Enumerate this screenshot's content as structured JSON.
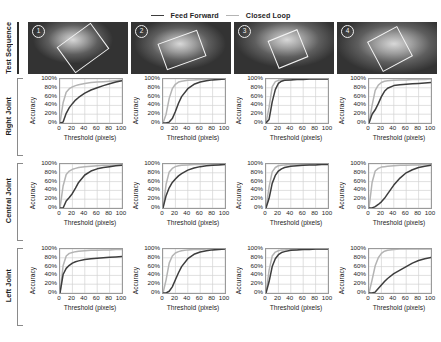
{
  "legend": {
    "items": [
      {
        "label": "Feed Forward",
        "color": "#3d3d3d",
        "icon": "line-swatch-icon"
      },
      {
        "label": "Closed Loop",
        "color": "#b4b4b4",
        "icon": "line-swatch-icon"
      }
    ]
  },
  "rows": [
    {
      "label": "Test Sequence"
    },
    {
      "label": "Right Joint"
    },
    {
      "label": "Central Joint"
    },
    {
      "label": "Left Joint"
    }
  ],
  "sequence": {
    "frames": [
      {
        "badge": "1"
      },
      {
        "badge": "2"
      },
      {
        "badge": "3"
      },
      {
        "badge": "4"
      }
    ]
  },
  "axes": {
    "xlabel": "Threshold (pixels)",
    "ylabel": "Accuracy",
    "xticks": [
      "0",
      "20",
      "40",
      "60",
      "80",
      "100"
    ],
    "yticks": [
      "100%",
      "80%",
      "60%",
      "40%",
      "20%",
      "0%"
    ],
    "xlim": [
      0,
      100
    ],
    "ylim": [
      0,
      100
    ]
  },
  "chart_data": [
    {
      "type": "line",
      "title": "Right Joint - Sequence 1",
      "row": "Right Joint",
      "column": 1,
      "xlabel": "Threshold (pixels)",
      "ylabel": "Accuracy",
      "xlim": [
        0,
        100
      ],
      "ylim": [
        0,
        100
      ],
      "grid": true,
      "legend_position": "top-center",
      "x": [
        0,
        5,
        10,
        15,
        20,
        25,
        30,
        40,
        50,
        60,
        70,
        80,
        90,
        100
      ],
      "series": [
        {
          "name": "Closed Loop",
          "color": "#b4b4b4",
          "values": [
            0,
            46,
            70,
            78,
            82,
            85,
            87,
            90,
            92,
            93,
            94,
            95,
            96,
            97
          ]
        },
        {
          "name": "Feed Forward",
          "color": "#3d3d3d",
          "values": [
            0,
            2,
            22,
            35,
            44,
            52,
            58,
            68,
            75,
            80,
            85,
            89,
            93,
            96
          ]
        }
      ]
    },
    {
      "type": "line",
      "title": "Right Joint - Sequence 2",
      "row": "Right Joint",
      "column": 2,
      "xlabel": "Threshold (pixels)",
      "ylabel": "Accuracy",
      "xlim": [
        0,
        100
      ],
      "ylim": [
        0,
        100
      ],
      "grid": true,
      "x": [
        0,
        5,
        10,
        15,
        20,
        25,
        30,
        40,
        50,
        60,
        70,
        80,
        90,
        100
      ],
      "series": [
        {
          "name": "Closed Loop",
          "color": "#b4b4b4",
          "values": [
            0,
            20,
            56,
            78,
            88,
            93,
            95,
            97,
            98,
            99,
            99,
            100,
            100,
            100
          ]
        },
        {
          "name": "Feed Forward",
          "color": "#3d3d3d",
          "values": [
            0,
            0,
            2,
            10,
            26,
            45,
            60,
            78,
            88,
            93,
            96,
            98,
            99,
            100
          ]
        }
      ]
    },
    {
      "type": "line",
      "title": "Right Joint - Sequence 3",
      "row": "Right Joint",
      "column": 3,
      "xlabel": "Threshold (pixels)",
      "ylabel": "Accuracy",
      "xlim": [
        0,
        100
      ],
      "ylim": [
        0,
        100
      ],
      "grid": true,
      "x": [
        0,
        5,
        10,
        15,
        20,
        25,
        30,
        40,
        50,
        60,
        70,
        80,
        90,
        100
      ],
      "series": [
        {
          "name": "Closed Loop",
          "color": "#b4b4b4",
          "values": [
            0,
            36,
            82,
            94,
            97,
            98,
            99,
            99,
            100,
            100,
            100,
            100,
            100,
            100
          ]
        },
        {
          "name": "Feed Forward",
          "color": "#3d3d3d",
          "values": [
            0,
            8,
            48,
            76,
            90,
            95,
            97,
            98,
            99,
            99,
            100,
            100,
            100,
            100
          ]
        }
      ]
    },
    {
      "type": "line",
      "title": "Right Joint - Sequence 4",
      "row": "Right Joint",
      "column": 4,
      "xlabel": "Threshold (pixels)",
      "ylabel": "Accuracy",
      "xlim": [
        0,
        100
      ],
      "ylim": [
        0,
        100
      ],
      "grid": true,
      "x": [
        0,
        5,
        10,
        15,
        20,
        25,
        30,
        40,
        50,
        60,
        70,
        80,
        90,
        100
      ],
      "series": [
        {
          "name": "Closed Loop",
          "color": "#b4b4b4",
          "values": [
            0,
            40,
            74,
            86,
            92,
            95,
            96,
            97,
            98,
            98,
            99,
            99,
            99,
            100
          ]
        },
        {
          "name": "Feed Forward",
          "color": "#3d3d3d",
          "values": [
            0,
            20,
            30,
            44,
            60,
            72,
            79,
            85,
            87,
            88,
            89,
            90,
            91,
            92
          ]
        }
      ]
    },
    {
      "type": "line",
      "title": "Central Joint - Sequence 1",
      "row": "Central Joint",
      "column": 1,
      "xlabel": "Threshold (pixels)",
      "ylabel": "Accuracy",
      "xlim": [
        0,
        100
      ],
      "ylim": [
        0,
        100
      ],
      "grid": true,
      "x": [
        0,
        5,
        10,
        15,
        20,
        25,
        30,
        40,
        50,
        60,
        70,
        80,
        90,
        100
      ],
      "series": [
        {
          "name": "Closed Loop",
          "color": "#b4b4b4",
          "values": [
            0,
            50,
            76,
            84,
            88,
            90,
            92,
            94,
            95,
            96,
            97,
            97,
            98,
            98
          ]
        },
        {
          "name": "Feed Forward",
          "color": "#3d3d3d",
          "values": [
            0,
            0,
            16,
            24,
            33,
            45,
            58,
            75,
            84,
            89,
            92,
            94,
            96,
            97
          ]
        }
      ]
    },
    {
      "type": "line",
      "title": "Central Joint - Sequence 2",
      "row": "Central Joint",
      "column": 2,
      "xlabel": "Threshold (pixels)",
      "ylabel": "Accuracy",
      "xlim": [
        0,
        100
      ],
      "ylim": [
        0,
        100
      ],
      "grid": true,
      "x": [
        0,
        5,
        10,
        15,
        20,
        25,
        30,
        40,
        50,
        60,
        70,
        80,
        90,
        100
      ],
      "series": [
        {
          "name": "Closed Loop",
          "color": "#b4b4b4",
          "values": [
            0,
            54,
            82,
            90,
            94,
            96,
            97,
            98,
            99,
            99,
            100,
            100,
            100,
            100
          ]
        },
        {
          "name": "Feed Forward",
          "color": "#3d3d3d",
          "values": [
            0,
            28,
            46,
            58,
            66,
            73,
            78,
            86,
            91,
            94,
            96,
            97,
            98,
            99
          ]
        }
      ]
    },
    {
      "type": "line",
      "title": "Central Joint - Sequence 3",
      "row": "Central Joint",
      "column": 3,
      "xlabel": "Threshold (pixels)",
      "ylabel": "Accuracy",
      "xlim": [
        0,
        100
      ],
      "ylim": [
        0,
        100
      ],
      "grid": true,
      "x": [
        0,
        5,
        10,
        15,
        20,
        25,
        30,
        40,
        50,
        60,
        70,
        80,
        90,
        100
      ],
      "series": [
        {
          "name": "Closed Loop",
          "color": "#b4b4b4",
          "values": [
            0,
            48,
            82,
            92,
            96,
            97,
            98,
            99,
            99,
            100,
            100,
            100,
            100,
            100
          ]
        },
        {
          "name": "Feed Forward",
          "color": "#3d3d3d",
          "values": [
            0,
            22,
            56,
            74,
            84,
            89,
            92,
            95,
            96,
            97,
            98,
            98,
            99,
            99
          ]
        }
      ]
    },
    {
      "type": "line",
      "title": "Central Joint - Sequence 4",
      "row": "Central Joint",
      "column": 4,
      "xlabel": "Threshold (pixels)",
      "ylabel": "Accuracy",
      "xlim": [
        0,
        100
      ],
      "ylim": [
        0,
        100
      ],
      "grid": true,
      "x": [
        0,
        5,
        10,
        15,
        20,
        25,
        30,
        40,
        50,
        60,
        70,
        80,
        90,
        100
      ],
      "series": [
        {
          "name": "Closed Loop",
          "color": "#b4b4b4",
          "values": [
            0,
            58,
            84,
            90,
            93,
            94,
            95,
            96,
            97,
            97,
            98,
            98,
            99,
            99
          ]
        },
        {
          "name": "Feed Forward",
          "color": "#3d3d3d",
          "values": [
            0,
            0,
            3,
            8,
            14,
            22,
            32,
            52,
            68,
            80,
            87,
            92,
            95,
            97
          ]
        }
      ]
    },
    {
      "type": "line",
      "title": "Left Joint - Sequence 1",
      "row": "Left Joint",
      "column": 1,
      "xlabel": "Threshold (pixels)",
      "ylabel": "Accuracy",
      "xlim": [
        0,
        100
      ],
      "ylim": [
        0,
        100
      ],
      "grid": true,
      "x": [
        0,
        5,
        10,
        15,
        20,
        25,
        30,
        40,
        50,
        60,
        70,
        80,
        90,
        100
      ],
      "series": [
        {
          "name": "Closed Loop",
          "color": "#b4b4b4",
          "values": [
            0,
            62,
            84,
            90,
            92,
            94,
            95,
            96,
            97,
            97,
            98,
            98,
            99,
            99
          ]
        },
        {
          "name": "Feed Forward",
          "color": "#3d3d3d",
          "values": [
            0,
            42,
            56,
            63,
            68,
            71,
            73,
            76,
            78,
            79,
            80,
            81,
            82,
            83
          ]
        }
      ]
    },
    {
      "type": "line",
      "title": "Left Joint - Sequence 2",
      "row": "Left Joint",
      "column": 2,
      "xlabel": "Threshold (pixels)",
      "ylabel": "Accuracy",
      "xlim": [
        0,
        100
      ],
      "ylim": [
        0,
        100
      ],
      "grid": true,
      "x": [
        0,
        5,
        10,
        15,
        20,
        25,
        30,
        40,
        50,
        60,
        70,
        80,
        90,
        100
      ],
      "series": [
        {
          "name": "Closed Loop",
          "color": "#b4b4b4",
          "values": [
            0,
            30,
            68,
            84,
            91,
            94,
            96,
            98,
            99,
            99,
            100,
            100,
            100,
            100
          ]
        },
        {
          "name": "Feed Forward",
          "color": "#3d3d3d",
          "values": [
            0,
            0,
            4,
            14,
            30,
            46,
            60,
            78,
            88,
            93,
            96,
            98,
            99,
            100
          ]
        }
      ]
    },
    {
      "type": "line",
      "title": "Left Joint - Sequence 3",
      "row": "Left Joint",
      "column": 3,
      "xlabel": "Threshold (pixels)",
      "ylabel": "Accuracy",
      "xlim": [
        0,
        100
      ],
      "ylim": [
        0,
        100
      ],
      "grid": true,
      "x": [
        0,
        5,
        10,
        15,
        20,
        25,
        30,
        40,
        50,
        60,
        70,
        80,
        90,
        100
      ],
      "series": [
        {
          "name": "Closed Loop",
          "color": "#b4b4b4",
          "values": [
            0,
            52,
            84,
            93,
            96,
            98,
            98,
            99,
            100,
            100,
            100,
            100,
            100,
            100
          ]
        },
        {
          "name": "Feed Forward",
          "color": "#3d3d3d",
          "values": [
            0,
            26,
            60,
            78,
            87,
            92,
            94,
            97,
            98,
            99,
            99,
            100,
            100,
            100
          ]
        }
      ]
    },
    {
      "type": "line",
      "title": "Left Joint - Sequence 4",
      "row": "Left Joint",
      "column": 4,
      "xlabel": "Threshold (pixels)",
      "ylabel": "Accuracy",
      "xlim": [
        0,
        100
      ],
      "ylim": [
        0,
        100
      ],
      "grid": true,
      "x": [
        0,
        5,
        10,
        15,
        20,
        25,
        30,
        40,
        50,
        60,
        70,
        80,
        90,
        100
      ],
      "series": [
        {
          "name": "Closed Loop",
          "color": "#b4b4b4",
          "values": [
            0,
            30,
            62,
            80,
            90,
            95,
            97,
            99,
            100,
            100,
            100,
            100,
            100,
            100
          ]
        },
        {
          "name": "Feed Forward",
          "color": "#3d3d3d",
          "values": [
            0,
            0,
            2,
            10,
            18,
            26,
            33,
            44,
            52,
            60,
            68,
            74,
            78,
            81
          ]
        }
      ]
    }
  ]
}
